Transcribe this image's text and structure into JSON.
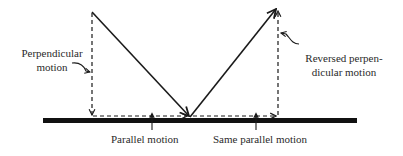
{
  "diagram": {
    "labels": {
      "perpendicular_line1": "Perpendicular",
      "perpendicular_line2": "motion",
      "parallel": "Parallel motion",
      "same_parallel": "Same parallel motion",
      "reversed_line1": "Reversed perpen-",
      "reversed_line2": "dicular motion"
    },
    "colors": {
      "stroke": "#1a1a1a",
      "surface": "#111111",
      "text": "#2a2a2a",
      "background": "#ffffff"
    },
    "elements": [
      {
        "id": "surface",
        "type": "thick-line",
        "from": [
          43,
          120
        ],
        "to": [
          357,
          120
        ]
      },
      {
        "id": "incoming-vector",
        "type": "solid-arrow",
        "from": [
          92,
          12
        ],
        "to": [
          190,
          117
        ]
      },
      {
        "id": "outgoing-vector",
        "type": "solid-arrow",
        "from": [
          190,
          117
        ],
        "to": [
          277,
          8
        ]
      },
      {
        "id": "perpendicular-component",
        "type": "dashed-arrow",
        "from": [
          92,
          12
        ],
        "to": [
          92,
          116
        ]
      },
      {
        "id": "parallel-component",
        "type": "dashed-arrow",
        "from": [
          92,
          116
        ],
        "to": [
          188,
          116
        ]
      },
      {
        "id": "same-parallel-component",
        "type": "dashed-arrow",
        "from": [
          192,
          116
        ],
        "to": [
          277,
          116
        ]
      },
      {
        "id": "reversed-perpendicular-component",
        "type": "dashed-arrow",
        "from": [
          278,
          116
        ],
        "to": [
          278,
          10
        ]
      }
    ]
  }
}
